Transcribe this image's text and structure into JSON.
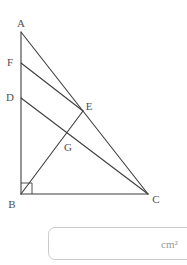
{
  "figure": {
    "stroke_color": "#3d3d3d",
    "stroke_width": 1.1,
    "label_color": "#4f4f4f",
    "label_font_size": 11,
    "points": {
      "A": {
        "label": "A",
        "x": 21,
        "y": 32,
        "lx": 21,
        "ly": 27
      },
      "F": {
        "label": "F",
        "x": 21,
        "y": 63,
        "lx": 10,
        "ly": 66
      },
      "D": {
        "label": "D",
        "x": 21,
        "y": 98,
        "lx": 10,
        "ly": 101
      },
      "E": {
        "label": "E",
        "x": 83,
        "y": 111,
        "lx": 89,
        "ly": 110
      },
      "G": {
        "label": "G",
        "x": 67,
        "y": 133,
        "lx": 68,
        "ly": 151
      },
      "B": {
        "label": "B",
        "x": 21,
        "y": 194,
        "lx": 12,
        "ly": 208
      },
      "C": {
        "label": "C",
        "x": 148,
        "y": 194,
        "lx": 156,
        "ly": 203
      }
    },
    "segments": [
      [
        "A",
        "B"
      ],
      [
        "B",
        "C"
      ],
      [
        "A",
        "C"
      ],
      [
        "F",
        "E"
      ],
      [
        "D",
        "C"
      ],
      [
        "B",
        "E"
      ]
    ],
    "right_angle_mark": {
      "corner_x": 21,
      "corner_y": 194,
      "size": 11
    }
  },
  "answer": {
    "value": "",
    "placeholder": "",
    "unit": "cm²",
    "border_color": "#cccccc",
    "unit_color": "#999999"
  }
}
